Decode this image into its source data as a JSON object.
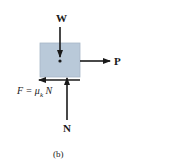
{
  "diagram": {
    "type": "free-body-diagram",
    "caption": "(b)",
    "body": {
      "shape": "rectangle",
      "fill": "#b9c9d9",
      "border": "#a7b7c7"
    },
    "forces": [
      {
        "name": "W",
        "label": "W",
        "direction": "down",
        "description": "weight"
      },
      {
        "name": "P",
        "label": "P",
        "direction": "right",
        "description": "applied force"
      },
      {
        "name": "F",
        "label": "F = μ",
        "subscript": "k",
        "label_suffix": " N",
        "direction": "left",
        "description": "kinetic friction"
      },
      {
        "name": "N",
        "label": "N",
        "direction": "up",
        "description": "normal force"
      }
    ],
    "colors": {
      "arrow": "#1a1a1a",
      "text": "#1a1a1a"
    }
  }
}
